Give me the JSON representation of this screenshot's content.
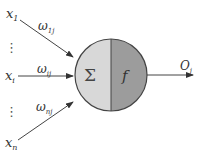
{
  "diagram": {
    "inputs": [
      {
        "label": "x",
        "sub": "1",
        "weight": "ω",
        "weight_sub": "1j"
      },
      {
        "label": "x",
        "sub": "i",
        "weight": "ω",
        "weight_sub": "ij"
      },
      {
        "label": "x",
        "sub": "n",
        "weight": "ω",
        "weight_sub": "nj"
      }
    ],
    "ellipsis": "⋮",
    "summation_symbol": "Σ",
    "activation_symbol": "f",
    "output": {
      "label": "O",
      "sub": "j"
    },
    "colors": {
      "sum_half": "#d8d8d8",
      "activation_half": "#9c9c9c",
      "stroke": "#444444"
    }
  }
}
